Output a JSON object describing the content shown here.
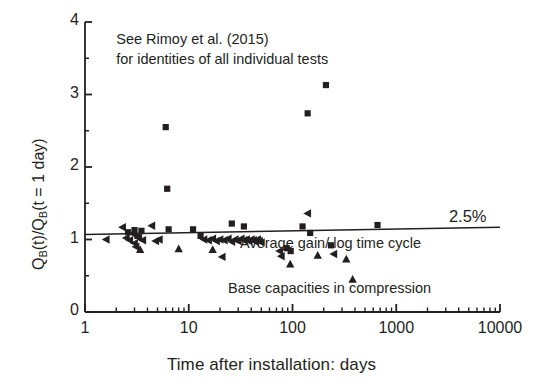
{
  "chart_data": {
    "type": "scatter",
    "title": "",
    "xlabel": "Time after installation: days",
    "ylabel": "Q_B(t)/Q_B(t = 1 day)",
    "ylabel_parts": {
      "q1": "Q",
      "sub1": "B",
      "mid": "(t)/Q",
      "sub2": "B",
      "tail": "(t = 1 day)"
    },
    "xscale": "log",
    "yscale": "linear",
    "xlim": [
      1,
      10000
    ],
    "ylim": [
      0,
      4
    ],
    "xticks": [
      1,
      10,
      100,
      1000,
      10000
    ],
    "xticklabels": [
      "1",
      "10",
      "100",
      "1000",
      "10000"
    ],
    "yticks": [
      0,
      1,
      2,
      3,
      4
    ],
    "yticklabels": [
      "0",
      "1",
      "2",
      "3",
      "4"
    ],
    "yminorticks": [
      0.5,
      1.5,
      2.5,
      3.5
    ],
    "grid": false,
    "legend": null,
    "annotations": [
      {
        "name": "source-note",
        "text_line1": "See Rimoy et al. (2015)",
        "text_line2": "for identities of all individual tests",
        "x": 2.0,
        "y": 3.75
      },
      {
        "name": "percent-label",
        "text": "2.5%",
        "x": 4200,
        "y": 1.28
      },
      {
        "name": "trend-caption",
        "text": "Average gain/ log time cycle",
        "x": 320,
        "y": 0.96
      },
      {
        "name": "series-caption",
        "text": "Base capacities in compression",
        "x": 120,
        "y": 0.33
      }
    ],
    "trendline": {
      "name": "average-gain-line",
      "label": "2.5%",
      "x": [
        1,
        10000
      ],
      "y": [
        1.07,
        1.17
      ],
      "color": "#231f20"
    },
    "series": [
      {
        "name": "square-markers",
        "marker": "square",
        "color": "#231f20",
        "points": [
          [
            2.6,
            1.1
          ],
          [
            3.0,
            1.13
          ],
          [
            3.2,
            1.05
          ],
          [
            3.5,
            1.12
          ],
          [
            6.0,
            2.55
          ],
          [
            6.2,
            1.7
          ],
          [
            6.4,
            1.14
          ],
          [
            11.0,
            1.14
          ],
          [
            13.0,
            1.05
          ],
          [
            26.0,
            1.22
          ],
          [
            34.0,
            1.18
          ],
          [
            88.0,
            0.88
          ],
          [
            96.0,
            0.84
          ],
          [
            125.0,
            1.18
          ],
          [
            140.0,
            2.74
          ],
          [
            148.0,
            1.09
          ],
          [
            210.0,
            3.13
          ],
          [
            235.0,
            0.92
          ],
          [
            660.0,
            1.2
          ]
        ]
      },
      {
        "name": "left-triangle-markers",
        "marker": "triangle-left",
        "color": "#231f20",
        "points": [
          [
            1.6,
            1.0
          ],
          [
            2.3,
            1.17
          ],
          [
            2.5,
            1.02
          ],
          [
            2.7,
            0.99
          ],
          [
            2.9,
            1.08
          ],
          [
            3.0,
            0.95
          ],
          [
            3.1,
            0.9
          ],
          [
            3.3,
            1.02
          ],
          [
            3.6,
            0.99
          ],
          [
            4.4,
            1.19
          ],
          [
            4.8,
            0.98
          ],
          [
            5.2,
            1.0
          ],
          [
            14.0,
            1.0
          ],
          [
            15.5,
            0.99
          ],
          [
            17.0,
            1.01
          ],
          [
            18.5,
            0.98
          ],
          [
            20.0,
            1.0
          ],
          [
            22.0,
            0.99
          ],
          [
            24.0,
            1.01
          ],
          [
            26.0,
            0.97
          ],
          [
            28.0,
            1.0
          ],
          [
            30.0,
            0.98
          ],
          [
            32.0,
            1.01
          ],
          [
            34.0,
            0.99
          ],
          [
            36.0,
            1.0
          ],
          [
            38.0,
            0.98
          ],
          [
            40.0,
            1.0
          ],
          [
            42.0,
            0.99
          ],
          [
            44.0,
            0.97
          ],
          [
            46.0,
            1.0
          ],
          [
            48.0,
            0.98
          ],
          [
            50.0,
            0.96
          ],
          [
            21.0,
            0.76
          ],
          [
            75.0,
            0.84
          ],
          [
            78.0,
            0.77
          ],
          [
            140.0,
            1.36
          ],
          [
            250.0,
            0.8
          ]
        ]
      },
      {
        "name": "up-triangle-markers",
        "marker": "triangle-up",
        "color": "#231f20",
        "points": [
          [
            3.4,
            0.86
          ],
          [
            8.0,
            0.87
          ],
          [
            17.0,
            0.86
          ],
          [
            95.0,
            0.66
          ],
          [
            175.0,
            0.78
          ],
          [
            330.0,
            0.73
          ],
          [
            380.0,
            0.45
          ]
        ]
      }
    ]
  },
  "axes": {
    "name": "plot-axes",
    "frame_color": "#231f20"
  }
}
